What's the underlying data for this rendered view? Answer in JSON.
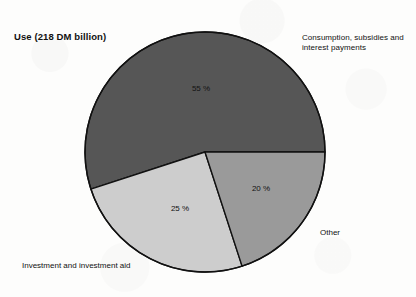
{
  "figure": {
    "title": "Use (218 DM billion)",
    "background_color": "#fdfdfc",
    "outline_color": "#111111"
  },
  "labels": {
    "consumption": "Consumption, subsidies and\ninterest payments",
    "investment": "Investment and investment aid",
    "other": "Other"
  },
  "chart_data": {
    "type": "pie",
    "title": "Use (218 DM billion)",
    "subtitle": "",
    "xlabel": "",
    "ylabel": "",
    "total_value": 218,
    "total_unit": "DM billion",
    "legend_position": "callout-labels",
    "grid": false,
    "start_angle_deg": 0,
    "direction": "counterclockwise",
    "categories": [
      "Consumption, subsidies and interest payments",
      "Investment and investment aid",
      "Other"
    ],
    "values": [
      55,
      25,
      20
    ],
    "value_labels": [
      "55 %",
      "25 %",
      "20 %"
    ],
    "colors": [
      "#565656",
      "#cdcdcd",
      "#9a9a9a"
    ],
    "slices": [
      {
        "name": "Consumption, subsidies and interest payments",
        "percent": 55,
        "label": "55 %",
        "color": "#565656",
        "start_angle_deg": 0,
        "end_angle_deg": 198,
        "callout": "Consumption, subsidies and\ninterest payments"
      },
      {
        "name": "Investment and investment aid",
        "percent": 25,
        "label": "25 %",
        "color": "#cdcdcd",
        "start_angle_deg": 198,
        "end_angle_deg": 288,
        "callout": "Investment and investment aid"
      },
      {
        "name": "Other",
        "percent": 20,
        "label": "20 %",
        "color": "#9a9a9a",
        "start_angle_deg": 288,
        "end_angle_deg": 360,
        "callout": "Other"
      }
    ]
  }
}
